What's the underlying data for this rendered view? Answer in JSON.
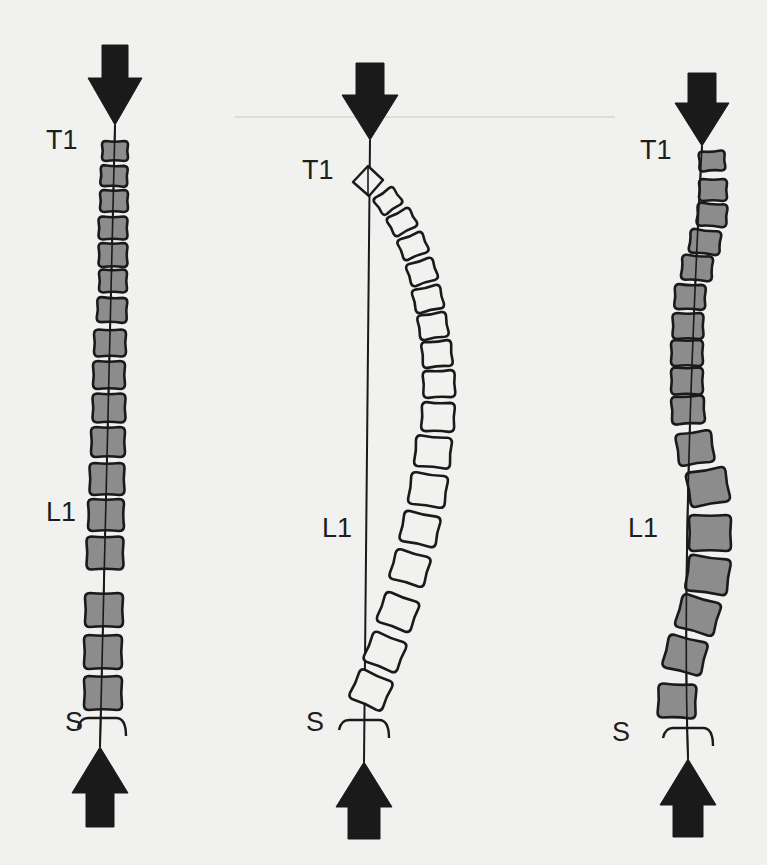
{
  "figure": {
    "colors": {
      "background": "#f1f1f0",
      "ink": "#1a1a1a",
      "vertebra_fill": "#8c8c8c",
      "vertebra_hollow": "#f1f1f0",
      "guide_line": "#c8c8c8"
    },
    "guide_line": {
      "x1": 235,
      "x2": 615,
      "y": 117
    },
    "panels": [
      {
        "id": "straight",
        "fill": "filled",
        "labels": {
          "top": "T1",
          "middle": "L1",
          "bottom": "S"
        },
        "label_pos": {
          "top": [
            46,
            140
          ],
          "middle": [
            46,
            512
          ],
          "bottom": [
            65,
            722
          ]
        },
        "top_arrow": {
          "cx": 115,
          "shaft_top": 45,
          "head_base": 78,
          "tip": 125,
          "shaft_half": 13,
          "head_half": 27
        },
        "bottom_arrow": {
          "cx": 100,
          "tip": 747,
          "head_base": 793,
          "shaft_bottom": 827,
          "shaft_half": 14,
          "head_half": 28
        },
        "axis": {
          "x1": 115,
          "y1": 125,
          "x2": 100,
          "y2": 747
        },
        "sacrum": {
          "cx": 102,
          "y": 718,
          "half": 24
        },
        "vertebrae": [
          {
            "x": 115,
            "y": 151,
            "w": 26,
            "h": 20,
            "r": 0
          },
          {
            "x": 114,
            "y": 176,
            "w": 27,
            "h": 21,
            "r": 2
          },
          {
            "x": 114,
            "y": 201,
            "w": 28,
            "h": 22,
            "r": 0
          },
          {
            "x": 113,
            "y": 228,
            "w": 29,
            "h": 23,
            "r": 0
          },
          {
            "x": 113,
            "y": 255,
            "w": 29,
            "h": 24,
            "r": 0
          },
          {
            "x": 113,
            "y": 281,
            "w": 28,
            "h": 23,
            "r": 0
          },
          {
            "x": 112,
            "y": 310,
            "w": 30,
            "h": 25,
            "r": 2
          },
          {
            "x": 110,
            "y": 343,
            "w": 32,
            "h": 27,
            "r": 0
          },
          {
            "x": 109,
            "y": 375,
            "w": 32,
            "h": 28,
            "r": 0
          },
          {
            "x": 109,
            "y": 408,
            "w": 33,
            "h": 29,
            "r": 0
          },
          {
            "x": 108,
            "y": 442,
            "w": 34,
            "h": 30,
            "r": 0
          },
          {
            "x": 107,
            "y": 479,
            "w": 35,
            "h": 32,
            "r": 0
          },
          {
            "x": 106,
            "y": 515,
            "w": 36,
            "h": 32,
            "r": 0
          },
          {
            "x": 105,
            "y": 553,
            "w": 37,
            "h": 33,
            "r": 0
          },
          {
            "x": 104,
            "y": 610,
            "w": 38,
            "h": 34,
            "r": 0
          },
          {
            "x": 103,
            "y": 652,
            "w": 38,
            "h": 34,
            "r": 0
          },
          {
            "x": 103,
            "y": 693,
            "w": 38,
            "h": 34,
            "r": 0
          }
        ]
      },
      {
        "id": "kyphotic",
        "fill": "hollow",
        "labels": {
          "top": "T1",
          "middle": "L1",
          "bottom": "S"
        },
        "label_pos": {
          "top": [
            302,
            170
          ],
          "middle": [
            322,
            528
          ],
          "bottom": [
            306,
            722
          ]
        },
        "top_arrow": {
          "cx": 370,
          "shaft_top": 63,
          "head_base": 95,
          "tip": 140,
          "shaft_half": 14,
          "head_half": 28
        },
        "bottom_arrow": {
          "cx": 364,
          "tip": 762,
          "head_base": 807,
          "shaft_bottom": 839,
          "shaft_half": 16,
          "head_half": 28
        },
        "axis": {
          "x1": 370,
          "y1": 140,
          "x2": 364,
          "y2": 762
        },
        "sacrum": {
          "cx": 364,
          "y": 720,
          "half": 25
        },
        "t1_diamond": {
          "cx": 368,
          "cy": 181,
          "size": 15
        },
        "vertebrae": [
          {
            "x": 388,
            "y": 201,
            "w": 24,
            "h": 20,
            "r": -35
          },
          {
            "x": 402,
            "y": 222,
            "w": 26,
            "h": 21,
            "r": -28
          },
          {
            "x": 413,
            "y": 246,
            "w": 27,
            "h": 22,
            "r": -22
          },
          {
            "x": 422,
            "y": 272,
            "w": 28,
            "h": 23,
            "r": -18
          },
          {
            "x": 428,
            "y": 299,
            "w": 29,
            "h": 24,
            "r": -13
          },
          {
            "x": 433,
            "y": 326,
            "w": 29,
            "h": 25,
            "r": -9
          },
          {
            "x": 437,
            "y": 354,
            "w": 30,
            "h": 26,
            "r": -5
          },
          {
            "x": 439,
            "y": 384,
            "w": 32,
            "h": 27,
            "r": -2
          },
          {
            "x": 438,
            "y": 417,
            "w": 33,
            "h": 29,
            "r": 2
          },
          {
            "x": 433,
            "y": 452,
            "w": 36,
            "h": 31,
            "r": 5
          },
          {
            "x": 428,
            "y": 490,
            "w": 37,
            "h": 32,
            "r": 8
          },
          {
            "x": 420,
            "y": 529,
            "w": 37,
            "h": 31,
            "r": 12
          },
          {
            "x": 410,
            "y": 568,
            "w": 36,
            "h": 31,
            "r": 16
          },
          {
            "x": 398,
            "y": 612,
            "w": 36,
            "h": 32,
            "r": 20
          },
          {
            "x": 385,
            "y": 652,
            "w": 36,
            "h": 32,
            "r": 22
          },
          {
            "x": 371,
            "y": 690,
            "w": 36,
            "h": 32,
            "r": 24
          }
        ]
      },
      {
        "id": "scoliotic",
        "fill": "filled",
        "labels": {
          "top": "T1",
          "middle": "L1",
          "bottom": "S"
        },
        "label_pos": {
          "top": [
            640,
            150
          ],
          "middle": [
            628,
            528
          ],
          "bottom": [
            612,
            732
          ]
        },
        "top_arrow": {
          "cx": 702,
          "shaft_top": 73,
          "head_base": 103,
          "tip": 146,
          "shaft_half": 14,
          "head_half": 27
        },
        "bottom_arrow": {
          "cx": 688,
          "tip": 759,
          "head_base": 805,
          "shaft_bottom": 837,
          "shaft_half": 15,
          "head_half": 28
        },
        "axis": {
          "x1": 702,
          "y1": 146,
          "x2": 688,
          "y2": 759
        },
        "axis_mid": [
          685,
          540
        ],
        "sacrum": {
          "cx": 688,
          "y": 728,
          "half": 25
        },
        "vertebrae": [
          {
            "x": 712,
            "y": 161,
            "w": 26,
            "h": 20,
            "r": -3
          },
          {
            "x": 713,
            "y": 190,
            "w": 28,
            "h": 22,
            "r": 0
          },
          {
            "x": 712,
            "y": 215,
            "w": 30,
            "h": 23,
            "r": 4
          },
          {
            "x": 705,
            "y": 242,
            "w": 31,
            "h": 24,
            "r": 6
          },
          {
            "x": 697,
            "y": 268,
            "w": 31,
            "h": 25,
            "r": 4
          },
          {
            "x": 690,
            "y": 297,
            "w": 31,
            "h": 25,
            "r": 2
          },
          {
            "x": 688,
            "y": 326,
            "w": 31,
            "h": 26,
            "r": 0
          },
          {
            "x": 687,
            "y": 353,
            "w": 32,
            "h": 26,
            "r": 0
          },
          {
            "x": 687,
            "y": 381,
            "w": 32,
            "h": 27,
            "r": 0
          },
          {
            "x": 688,
            "y": 410,
            "w": 33,
            "h": 28,
            "r": -3
          },
          {
            "x": 695,
            "y": 448,
            "w": 36,
            "h": 32,
            "r": -8
          },
          {
            "x": 708,
            "y": 487,
            "w": 40,
            "h": 35,
            "r": -10
          },
          {
            "x": 710,
            "y": 533,
            "w": 42,
            "h": 36,
            "r": 0
          },
          {
            "x": 708,
            "y": 575,
            "w": 42,
            "h": 36,
            "r": 8
          },
          {
            "x": 698,
            "y": 615,
            "w": 40,
            "h": 34,
            "r": 16
          },
          {
            "x": 685,
            "y": 655,
            "w": 40,
            "h": 34,
            "r": 14
          },
          {
            "x": 677,
            "y": 701,
            "w": 38,
            "h": 34,
            "r": 2
          }
        ]
      }
    ]
  }
}
